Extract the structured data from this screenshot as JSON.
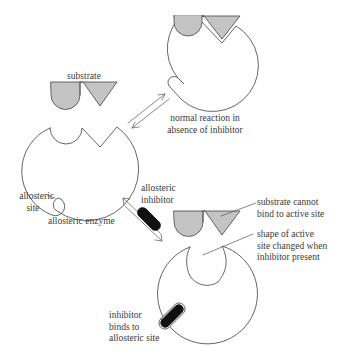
{
  "diagram": {
    "colors": {
      "outline": "#555555",
      "substrate_fill": "#c4c4c4",
      "inhibitor_fill": "#111111",
      "background": "#ffffff",
      "text": "#3a3a3a"
    },
    "labels": {
      "substrate": "substrate",
      "normal_reaction_line1": "normal reaction in",
      "normal_reaction_line2": "absence of inhibitor",
      "allosteric_site_line1": "allosteric",
      "allosteric_site_line2": "site",
      "allosteric_enzyme": "allosteric enzyme",
      "allosteric_inhibitor_line1": "allosteric",
      "allosteric_inhibitor_line2": "inhibitor",
      "cannot_bind_line1": "substrate cannot",
      "cannot_bind_line2": "bind to active site",
      "shape_changed_line1": "shape of active",
      "shape_changed_line2": "site changed when",
      "shape_changed_line3": "inhibitor present",
      "inhibitor_binds_line1": "inhibitor",
      "inhibitor_binds_line2": "binds to",
      "inhibitor_binds_line3": "allosteric site"
    },
    "nodes": [
      {
        "id": "free-enzyme",
        "label": "allosteric enzyme"
      },
      {
        "id": "substrate",
        "label": "substrate"
      },
      {
        "id": "enzyme-substrate-complex",
        "label": "normal reaction in absence of inhibitor"
      },
      {
        "id": "allosteric-inhibitor",
        "label": "allosteric inhibitor"
      },
      {
        "id": "inhibited-enzyme",
        "label": "inhibitor binds to allosteric site"
      }
    ],
    "edges": [
      {
        "from": "free-enzyme",
        "to": "enzyme-substrate-complex",
        "type": "reversible"
      },
      {
        "from": "free-enzyme",
        "to": "inhibited-enzyme",
        "type": "reversible"
      }
    ]
  }
}
